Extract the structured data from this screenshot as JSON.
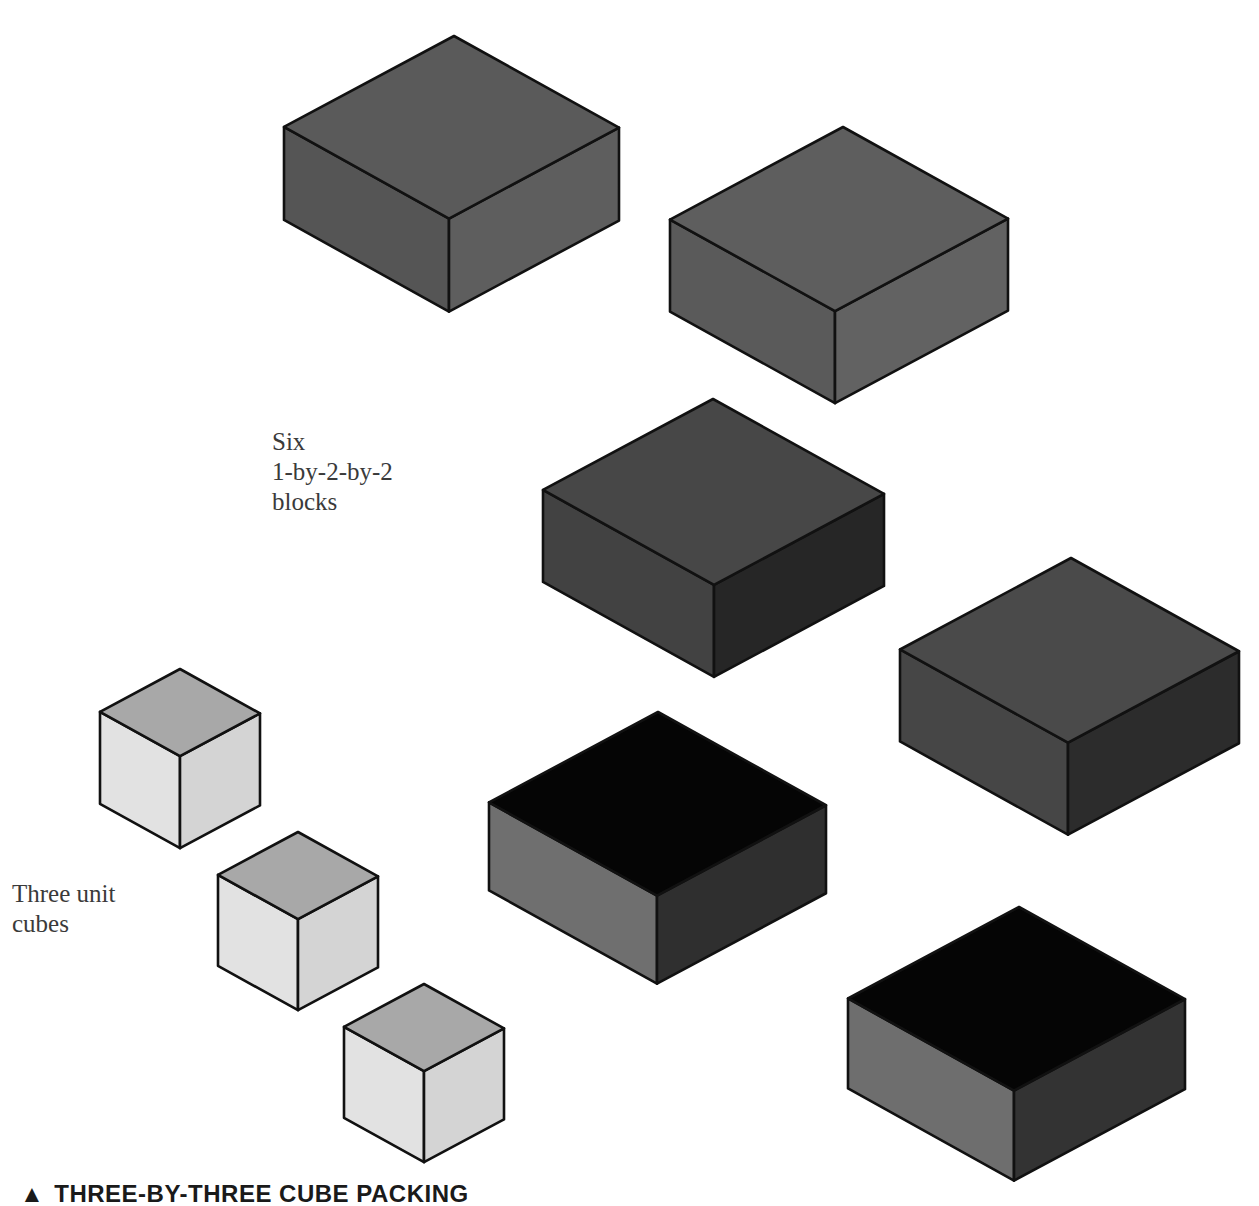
{
  "diagram": {
    "caption": {
      "marker": "▲",
      "text": "THREE-BY-THREE CUBE PACKING"
    },
    "labels": {
      "blocks": "Six\n1-by-2-by-2\nblocks",
      "cubes": "Three unit\ncubes"
    },
    "colors": {
      "outline": "#111111",
      "background": "#ffffff"
    },
    "blocks": [
      {
        "id": "block-1",
        "type": "1-by-2-by-2",
        "top": [
          454,
          36
        ],
        "w_left": 170,
        "w_right": 165,
        "dy": 93,
        "h": 93,
        "colors": {
          "top": "#5a5a5a",
          "left": "#555555",
          "right": "#5e5e5e"
        }
      },
      {
        "id": "block-2",
        "type": "1-by-2-by-2",
        "top": [
          843,
          127
        ],
        "w_left": 173,
        "w_right": 165,
        "dy": 94,
        "h": 92,
        "colors": {
          "top": "#5e5e5e",
          "left": "#5a5a5a",
          "right": "#626262"
        }
      },
      {
        "id": "block-3",
        "type": "1-by-2-by-2",
        "top": [
          713,
          399
        ],
        "w_left": 170,
        "w_right": 171,
        "dy": 95,
        "h": 92,
        "colors": {
          "top": "#474747",
          "left": "#424242",
          "right": "#262626"
        }
      },
      {
        "id": "block-4",
        "type": "1-by-2-by-2",
        "top": [
          1071,
          558
        ],
        "w_left": 171,
        "w_right": 168,
        "dy": 90,
        "h": 92,
        "colors": {
          "top": "#4a4a4a",
          "left": "#464646",
          "right": "#2c2c2c"
        }
      },
      {
        "id": "block-5",
        "type": "1-by-2-by-2",
        "top": [
          658,
          712
        ],
        "w_left": 169,
        "w_right": 168,
        "dy": 94,
        "h": 88,
        "colors": {
          "top": "#050505",
          "left": "#6f6f6f",
          "right": "#2f2f2f"
        }
      },
      {
        "id": "block-6",
        "type": "1-by-2-by-2",
        "top": [
          1019,
          907
        ],
        "w_left": 171,
        "w_right": 166,
        "dy": 90,
        "h": 90,
        "colors": {
          "top": "#050505",
          "left": "#6e6e6e",
          "right": "#333333"
        }
      }
    ],
    "cubes": [
      {
        "id": "cube-1",
        "type": "unit-cube",
        "top": [
          180,
          669
        ],
        "w_left": 77,
        "w_right": 82,
        "dy": 45,
        "h": 92,
        "colors": {
          "top": "#a8a8a8",
          "left": "#e2e2e2",
          "right": "#d4d4d4"
        }
      },
      {
        "id": "cube-2",
        "type": "unit-cube",
        "top": [
          298,
          832
        ],
        "w_left": 77,
        "w_right": 82,
        "dy": 45,
        "h": 91,
        "colors": {
          "top": "#a8a8a8",
          "left": "#e2e2e2",
          "right": "#d4d4d4"
        }
      },
      {
        "id": "cube-3",
        "type": "unit-cube",
        "top": [
          424,
          984
        ],
        "w_left": 50,
        "w_right": 82,
        "dy": 45,
        "h": 91,
        "colors": {
          "top": "#a8a8a8",
          "left": "#e2e2e2",
          "right": "#d4d4d4"
        }
      }
    ]
  }
}
